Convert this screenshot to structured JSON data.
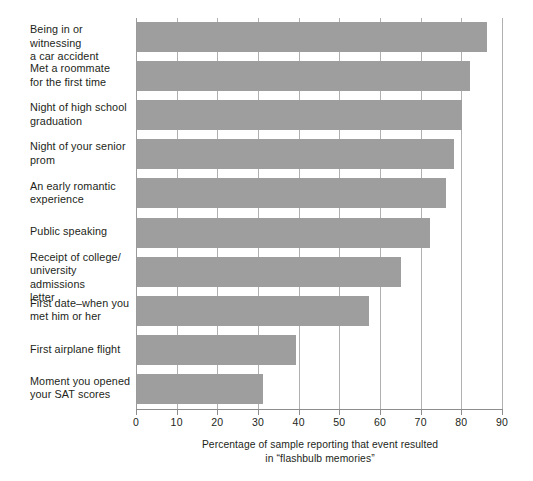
{
  "chart_data": {
    "type": "bar",
    "orientation": "horizontal",
    "title": "",
    "subtitle": "",
    "xlabel": "Percentage of sample reporting that event resulted in \"flashbulb memories\"",
    "ylabel": "",
    "xlim": [
      0,
      90
    ],
    "xticks": [
      0,
      10,
      20,
      30,
      40,
      50,
      60,
      70,
      80,
      90
    ],
    "xtick_labels": [
      "0",
      "10",
      "20",
      "30",
      "40",
      "50",
      "60",
      "70",
      "80",
      "90"
    ],
    "grid": "vertical gridlines at every x tick",
    "legend": "none",
    "bar_color": "#9e9e9e",
    "categories": [
      "Being in or witnessing a car accident",
      "Met a roommate for the first time",
      "Night of high school graduation",
      "Night of your senior prom",
      "An early romantic experience",
      "Public speaking",
      "Receipt of college/ university admissions letter",
      "First date–when you met him or her",
      "First airplane flight",
      "Moment you opened your SAT scores"
    ],
    "values": [
      86,
      82,
      80,
      78,
      76,
      72,
      65,
      57,
      39,
      31
    ]
  },
  "axis": {
    "caption_line1": "Percentage of sample reporting that event resulted",
    "caption_line2": "in “flashbulb memories”"
  },
  "categories_wrapped": [
    [
      "Being in or witnessing",
      "a car accident"
    ],
    [
      "Met a roommate",
      "for the first time"
    ],
    [
      "Night of high school",
      "graduation"
    ],
    [
      "Night of your senior",
      "prom"
    ],
    [
      "An early romantic",
      "experience"
    ],
    [
      "Public speaking"
    ],
    [
      "Receipt of college/",
      "university admissions",
      "letter"
    ],
    [
      "First date–when you",
      "met him or her"
    ],
    [
      "First airplane flight"
    ],
    [
      "Moment you opened",
      "your SAT scores"
    ]
  ]
}
